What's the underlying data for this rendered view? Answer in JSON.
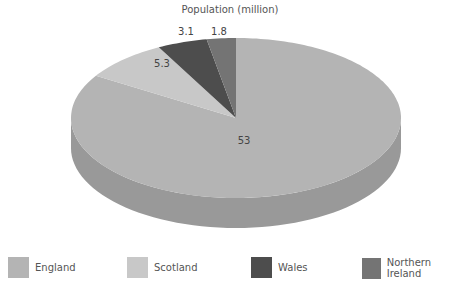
{
  "chart_data": {
    "type": "pie",
    "style": "3d",
    "title": "Population (million)",
    "categories": [
      "England",
      "Scotland",
      "Wales",
      "Northern Ireland"
    ],
    "values": [
      53,
      5.3,
      3.1,
      1.8
    ],
    "data_labels": [
      "53",
      "5.3",
      "3.1",
      "1.8"
    ],
    "colors": [
      "#b4b4b4",
      "#c8c8c8",
      "#4d4d4d",
      "#747474"
    ],
    "legend_position": "bottom"
  },
  "legend": [
    {
      "label": "England",
      "color": "#b4b4b4"
    },
    {
      "label": "Scotland",
      "color": "#c8c8c8"
    },
    {
      "label": "Wales",
      "color": "#4d4d4d"
    },
    {
      "label": "Northern Ireland",
      "color": "#747474"
    }
  ]
}
